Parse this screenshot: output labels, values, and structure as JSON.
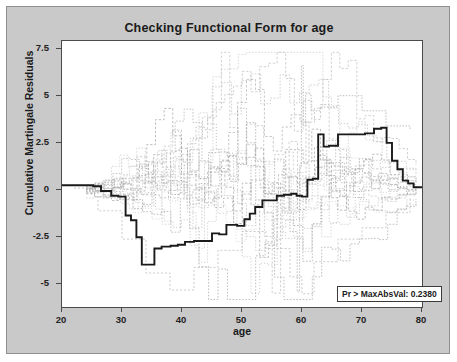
{
  "chart_data": {
    "type": "line",
    "title": "Checking Functional Form for age",
    "xlabel": "age",
    "ylabel": "Cumulative Martingale Residuals",
    "xlim": [
      20,
      80
    ],
    "ylim": [
      -6.2,
      7.9
    ],
    "xticks": [
      20,
      30,
      40,
      50,
      60,
      70,
      80
    ],
    "yticks": [
      7.5,
      5,
      2.5,
      0,
      -2.5,
      -5
    ],
    "grid": false,
    "legend_position": "bottom-right",
    "annotation": "Pr > MaxAbsVal: 0.2380",
    "series": [
      {
        "name": "Observed cumulative martingale residuals",
        "style": "bold-step",
        "color": "#1a1a1a",
        "x": [
          20,
          24,
          25.2,
          26.5,
          28.2,
          29.4,
          30.6,
          31.5,
          32.4,
          33.3,
          34.2,
          35.4,
          36.6,
          38.1,
          39.3,
          40.5,
          42.0,
          43.5,
          45.0,
          46.2,
          47.4,
          48.3,
          49.2,
          50.4,
          51.3,
          52.2,
          53.4,
          54.6,
          55.8,
          57.0,
          58.2,
          59.1,
          60.0,
          60.9,
          61.8,
          62.7,
          63.6,
          64.5,
          66.0,
          67.5,
          69.0,
          70.5,
          72.0,
          73.2,
          74.1,
          75.0,
          75.9,
          76.8,
          77.7,
          78.6,
          80
        ],
        "y": [
          0.25,
          0.25,
          0.2,
          -0.05,
          -0.3,
          -0.35,
          -1.35,
          -1.6,
          -2.5,
          -3.95,
          -3.95,
          -3.1,
          -3.0,
          -2.95,
          -2.9,
          -2.75,
          -2.7,
          -2.7,
          -2.3,
          -2.35,
          -1.85,
          -1.85,
          -1.9,
          -1.55,
          -1.25,
          -0.9,
          -0.55,
          -0.55,
          -0.3,
          -0.25,
          -0.2,
          -0.3,
          -0.35,
          0.55,
          0.6,
          2.95,
          2.3,
          2.35,
          2.95,
          2.95,
          2.95,
          3.0,
          3.25,
          3.3,
          2.5,
          1.55,
          1.1,
          0.5,
          0.35,
          0.15,
          0.15
        ]
      },
      {
        "name": "Simulated cumulative residual paths (20 realizations)",
        "style": "light-step",
        "color": "#b4b4b4",
        "count": 20
      }
    ]
  },
  "legend": {
    "text": "Pr > MaxAbsVal: 0.2380"
  },
  "axis": {
    "y_tick_labels": [
      "7.5",
      "5",
      "2.5",
      "0",
      "-2.5",
      "-5"
    ],
    "x_tick_labels": [
      "20",
      "30",
      "40",
      "50",
      "60",
      "70",
      "80"
    ]
  }
}
